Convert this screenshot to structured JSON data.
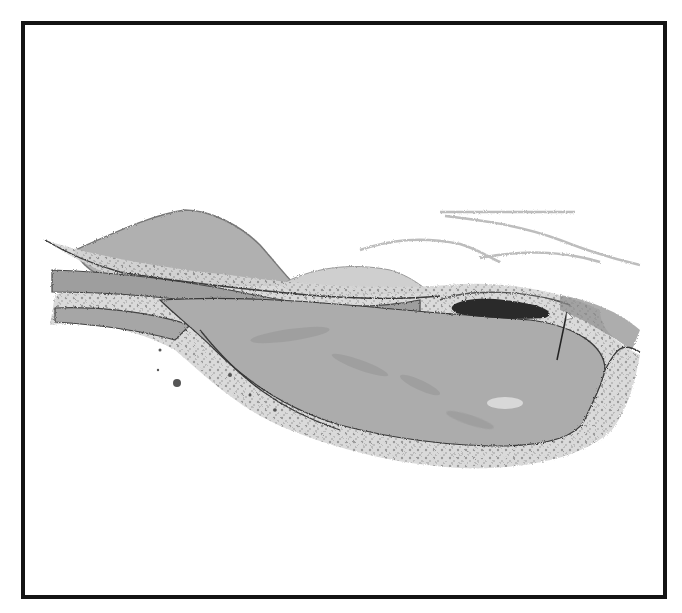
{
  "illustration": {
    "subject": "golf-green-sketch",
    "colors": {
      "frame": "#141414",
      "background": "#ffffff",
      "green": "#a9a9a9",
      "hill": "#b0b0b0",
      "fringe": "#d2d2d2",
      "bunker": "#2a2a2a",
      "line": "#3a3a3a"
    },
    "flag": {
      "pin_x": 557,
      "pin_top_y": 312,
      "pin_bottom_y": 360
    }
  }
}
